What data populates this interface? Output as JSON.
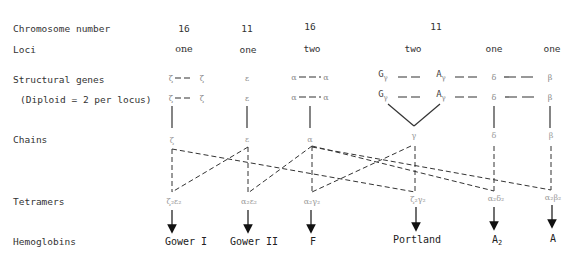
{
  "row_labels": {
    "chromosome": "Chromosome number",
    "loci": "Loci",
    "structural": "Structural genes",
    "diploid": "(Diploid = 2 per locus)",
    "chains": "Chains",
    "tetramers": "Tetramers",
    "hemoglobins": "Hemoglobins"
  },
  "columns": [
    {
      "id": "zeta",
      "chromosome": "16",
      "loci": "one",
      "gene_row1": "ζ — — ζ",
      "gene_row2": "ζ — — ζ",
      "chain": "ζ"
    },
    {
      "id": "epsilon",
      "chromosome": "11",
      "loci": "one",
      "gene_row1": "ε",
      "gene_row2": "ε",
      "chain": "ε"
    },
    {
      "id": "alpha",
      "chromosome": "16",
      "loci": "two",
      "gene_row1": "α — — α",
      "gene_row2": "α — — α",
      "chain": "α"
    },
    {
      "id": "gamma",
      "chromosome": "11",
      "loci": "two",
      "gene_G": "G",
      "gene_A": "A",
      "gene_sub": "γ",
      "chain": "γ"
    },
    {
      "id": "delta",
      "chromosome": "",
      "loci": "one",
      "gene_row1": "δ",
      "gene_row2": "δ",
      "chain": "δ"
    },
    {
      "id": "beta",
      "chromosome": "",
      "loci": "one",
      "gene_row1": "β",
      "gene_row2": "β",
      "chain": "β"
    }
  ],
  "tetramers": [
    {
      "label": "ζ₂ε₂"
    },
    {
      "label": "α₂ε₂"
    },
    {
      "label": "α₂γ₂"
    },
    {
      "label": "ζ₂γ₂"
    },
    {
      "label": "α₂δ₂"
    },
    {
      "label": "α₂β₂"
    }
  ],
  "hemoglobins": [
    {
      "name": "Gower I"
    },
    {
      "name": "Gower II"
    },
    {
      "name": "F"
    },
    {
      "name": "Portland"
    },
    {
      "name": "A",
      "sub": "2"
    },
    {
      "name": "A"
    }
  ]
}
